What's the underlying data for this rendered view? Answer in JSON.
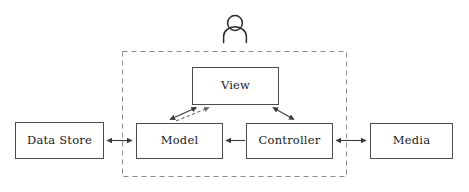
{
  "diagram": {
    "canvas": {
      "width": 469,
      "height": 192,
      "background": "#ffffff"
    },
    "colors": {
      "box_stroke": "#4d4d4d",
      "box_fill": "#ffffff",
      "boundary_stroke": "#8c8c8c",
      "edge_solid": "#3a3a3a",
      "edge_dashed": "#6a6a6a",
      "text": "#1a1a1a",
      "actor": "#2b2b2b"
    },
    "actor": {
      "icon": "person-icon",
      "label": "",
      "cx": 235,
      "head_cy": 23,
      "head_r": 7.5
    },
    "boundary": {
      "name": "application-boundary",
      "style": "dashed",
      "x": 122,
      "y": 51,
      "width": 225,
      "height": 126
    },
    "nodes": [
      {
        "id": "data-store",
        "label": "Data Store",
        "x": 15,
        "y": 122,
        "width": 88,
        "height": 36,
        "inside_boundary": false
      },
      {
        "id": "model",
        "label": "Model",
        "x": 136,
        "y": 123,
        "width": 86,
        "height": 35,
        "inside_boundary": true
      },
      {
        "id": "view",
        "label": "View",
        "x": 192,
        "y": 67,
        "width": 86,
        "height": 37,
        "inside_boundary": true
      },
      {
        "id": "controller",
        "label": "Controller",
        "x": 246,
        "y": 123,
        "width": 86,
        "height": 35,
        "inside_boundary": true
      },
      {
        "id": "media",
        "label": "Media",
        "x": 370,
        "y": 123,
        "width": 82,
        "height": 35,
        "inside_boundary": false
      }
    ],
    "edges": [
      {
        "id": "data-store-model",
        "from": "data-store",
        "to": "model",
        "style": "solid",
        "arrows": "both",
        "label": ""
      },
      {
        "id": "controller-model",
        "from": "controller",
        "to": "model",
        "style": "solid",
        "arrows": "to",
        "label": ""
      },
      {
        "id": "controller-media",
        "from": "controller",
        "to": "media",
        "style": "solid",
        "arrows": "both",
        "label": ""
      },
      {
        "id": "model-view",
        "from": "model",
        "to": "view",
        "style": "solid",
        "arrows": "both",
        "label": ""
      },
      {
        "id": "model-view-notify",
        "from": "model",
        "to": "view",
        "style": "dashed",
        "arrows": "to",
        "label": ""
      },
      {
        "id": "view-controller",
        "from": "view",
        "to": "controller",
        "style": "solid",
        "arrows": "both",
        "label": ""
      }
    ]
  }
}
